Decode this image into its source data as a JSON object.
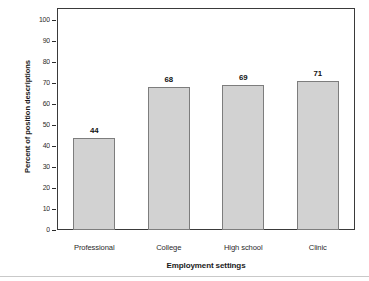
{
  "chart_data": {
    "type": "bar",
    "title": "",
    "xlabel": "Employment settings",
    "ylabel": "Percent of position descriptions",
    "categories": [
      "Professional",
      "College",
      "High school",
      "Clinic"
    ],
    "values": [
      44,
      68,
      69,
      71
    ],
    "value_labels": [
      "44",
      "68",
      "69",
      "71"
    ],
    "ylim": [
      0,
      100
    ],
    "ytick_step": 10,
    "ytick_labels": [
      "100",
      "90",
      "80",
      "70",
      "60",
      "50",
      "40",
      "30",
      "20",
      "10",
      "0"
    ],
    "ytick_values": [
      100,
      90,
      80,
      70,
      60,
      50,
      40,
      30,
      20,
      10,
      0
    ],
    "grid": false,
    "legend": null,
    "bar_fill_color": "#d2d2d2",
    "bar_border_color": "#7d7d7d",
    "frame_color": "#3a3a3a",
    "text_color": "#1a1a1a"
  }
}
